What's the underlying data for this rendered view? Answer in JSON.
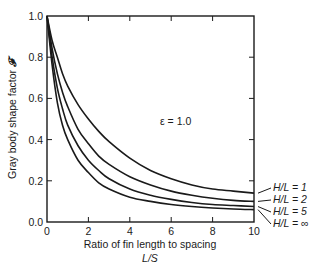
{
  "chart_data": {
    "type": "line",
    "title": "",
    "annotation": "ε = 1.0",
    "xlabel": "Ratio of fin length to spacing",
    "xlabel_sub": "L/S",
    "ylabel": "Gray body shape factor",
    "ylabel_symbol": "𝓕",
    "xlim": [
      0,
      10
    ],
    "ylim": [
      0,
      1.0
    ],
    "xticks": [
      0,
      2,
      4,
      6,
      8,
      10
    ],
    "xtick_labels": [
      "0",
      "2",
      "4",
      "6",
      "8",
      "10"
    ],
    "yticks": [
      0.0,
      0.2,
      0.4,
      0.6,
      0.8,
      1.0
    ],
    "ytick_labels": [
      "0.0",
      "0.2",
      "0.4",
      "0.6",
      "0.8",
      "1.0"
    ],
    "grid": false,
    "legend_position": "right, inline labels at x=10",
    "x": [
      0,
      0.25,
      0.5,
      0.75,
      1,
      1.5,
      2,
      2.5,
      3,
      4,
      5,
      6,
      7,
      8,
      9,
      10
    ],
    "series": [
      {
        "name": "H/L = 1",
        "label": "H/L = 1",
        "values": [
          1.0,
          0.88,
          0.8,
          0.72,
          0.66,
          0.57,
          0.5,
          0.44,
          0.39,
          0.31,
          0.25,
          0.21,
          0.18,
          0.16,
          0.15,
          0.14
        ]
      },
      {
        "name": "H/L = 2",
        "label": "H/L = 2",
        "values": [
          1.0,
          0.84,
          0.72,
          0.63,
          0.56,
          0.45,
          0.38,
          0.32,
          0.28,
          0.22,
          0.18,
          0.15,
          0.13,
          0.115,
          0.105,
          0.1
        ]
      },
      {
        "name": "H/L = 5",
        "label": "H/L = 5",
        "values": [
          1.0,
          0.8,
          0.65,
          0.55,
          0.47,
          0.37,
          0.3,
          0.25,
          0.21,
          0.16,
          0.13,
          0.11,
          0.095,
          0.085,
          0.08,
          0.075
        ]
      },
      {
        "name": "H/L = ∞",
        "label": "H/L = ∞",
        "values": [
          1.0,
          0.76,
          0.58,
          0.47,
          0.4,
          0.3,
          0.24,
          0.19,
          0.16,
          0.12,
          0.1,
          0.085,
          0.075,
          0.068,
          0.063,
          0.06
        ]
      }
    ]
  }
}
